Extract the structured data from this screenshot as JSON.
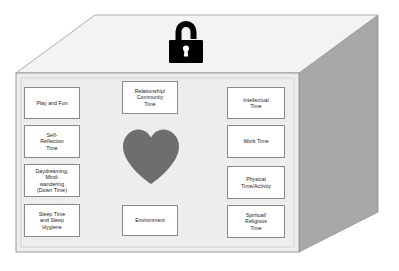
{
  "diagram": {
    "shape": "3d-box",
    "colors": {
      "front_face": "#ededed",
      "top_face": "#f2f2f2",
      "side_face": "#a8a8a8",
      "outline": "#7a7a7a",
      "card_border": "#8a8a8a",
      "card_fill": "#ffffff",
      "heart": "#6e6e6e",
      "padlock": "#000000",
      "text": "#1a1a1a",
      "background": "#ffffff"
    },
    "icons": {
      "padlock": "unlocked-padlock-icon",
      "heart": "heart-icon"
    }
  },
  "cards": {
    "left_column": [
      {
        "id": "play-and-fun",
        "lines": [
          "Play and Fun"
        ]
      },
      {
        "id": "self-reflection-time",
        "lines": [
          "Self-",
          "Reflection",
          "Time"
        ]
      },
      {
        "id": "daydreaming-mind-wandering",
        "lines": [
          "Daydreaming,",
          "Mind-",
          "wandering",
          "(Down Time)"
        ]
      },
      {
        "id": "sleep-time-and-sleep-hygiene",
        "lines": [
          "Sleep Time",
          "and Sleep",
          "Hygiene"
        ]
      }
    ],
    "center_column": [
      {
        "id": "relationship-community-time",
        "lines": [
          "Relationship/",
          "Community",
          "Time"
        ]
      },
      {
        "id": "environment",
        "lines": [
          "Environment"
        ]
      }
    ],
    "right_column": [
      {
        "id": "intellectual-time",
        "lines": [
          "Intellectual",
          "Time"
        ]
      },
      {
        "id": "work-time",
        "lines": [
          "Work Time"
        ]
      },
      {
        "id": "physical-time-activity",
        "lines": [
          "Physical",
          "Time/Activity"
        ]
      },
      {
        "id": "spiritual-religious-time",
        "lines": [
          "Spiritual/",
          "Religious",
          "Time"
        ]
      }
    ]
  },
  "labels": {
    "play_and_fun": "Play and Fun",
    "self_reflection_time": "Self-\nReflection\nTime",
    "daydreaming": "Daydreaming,\nMind-\nwandering\n(Down Time)",
    "sleep_time": "Sleep Time\nand Sleep\nHygiene",
    "relationship_community_time": "Relationship/\nCommunity\nTime",
    "environment": "Environment",
    "intellectual_time": "Intellectual\nTime",
    "work_time": "Work Time",
    "physical_time_activity": "Physical\nTime/Activity",
    "spiritual_religious_time": "Spiritual/\nReligious\nTime"
  }
}
